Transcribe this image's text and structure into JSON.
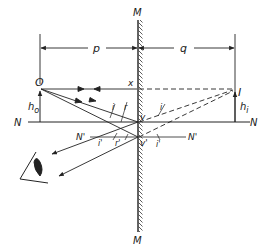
{
  "diagram": {
    "labels": {
      "mirror_top": "M",
      "mirror_bottom": "M",
      "object": "O",
      "image": "I",
      "object_distance": "p",
      "image_distance": "q",
      "object_height": "h",
      "object_height_sub": "o",
      "image_height": "h",
      "image_height_sub": "i",
      "image_height_prime": "'",
      "point_x": "x",
      "normal_left": "N",
      "normal_right": "N",
      "normal2_left": "N'",
      "normal2_right": "N'",
      "vertex": "v",
      "vertex2": "v'",
      "angle_i": "i",
      "angle_r": "r",
      "angle_i_image": "i",
      "angle_i2": "i'",
      "angle_r2": "r'",
      "angle_i2_image": "i'"
    },
    "colors": {
      "line": "#222222",
      "background": "#ffffff"
    }
  }
}
